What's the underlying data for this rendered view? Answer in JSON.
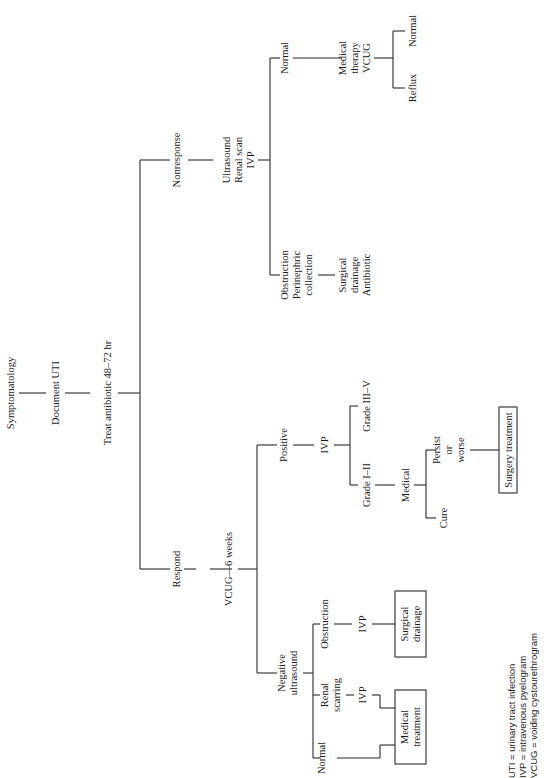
{
  "flowchart": {
    "root": "Symptomatology",
    "step2": "Document UTI",
    "step3": "Treat antibiotic 48–72 hr",
    "respond_branch": {
      "label": "Respond",
      "vcug": "VCUG—6 weeks",
      "positive": {
        "label": "Positive",
        "ivp": "IVP",
        "grade_low": "Grade I–II",
        "grade_high": "Grade III–V",
        "medical": "Medical",
        "cure": "Cure",
        "persist_1": "Persist",
        "persist_2": "or",
        "persist_3": "worse",
        "surgery_box": "Surgery treatment"
      },
      "negative": {
        "label_1": "Negative",
        "label_2": "ultrasound",
        "normal": "Normal",
        "renal_1": "Renal",
        "renal_2": "scarring",
        "renal_ivp": "IVP",
        "obstruction": "Obstruction",
        "obstruction_ivp": "IVP",
        "medical_box_1": "Medical",
        "medical_box_2": "treatment",
        "surgical_box_1": "Surgical",
        "surgical_box_2": "drainage"
      }
    },
    "nonresponse_branch": {
      "label": "Nonresponse",
      "tests_1": "Ultrasound",
      "tests_2": "Renal scan",
      "tests_3": "IVP",
      "obstruction_1": "Obstruction",
      "obstruction_2": "Perinephric",
      "obstruction_3": "collection",
      "surg_1": "Surgical",
      "surg_2": "drainage",
      "surg_3": "Antibiotic",
      "normal": "Normal",
      "med_1": "Medical",
      "med_2": "therapy",
      "med_3": "VCUG",
      "reflux": "Reflux",
      "normal_2": "Normal"
    }
  },
  "legend": {
    "line1": "UTI  =  urinary tract infection",
    "line2": "IVP  =  intravenous pyelogram",
    "line3": "VCUG  =  voiding cystourethrogram"
  }
}
